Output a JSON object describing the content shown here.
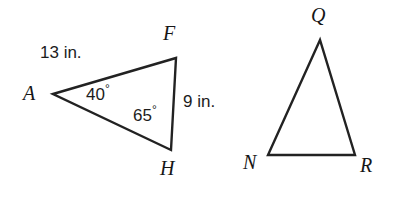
{
  "figure": {
    "background_color": "#ffffff",
    "stroke_color": "#222222",
    "stroke_width": 2.4,
    "width": 395,
    "height": 204
  },
  "triangle_left": {
    "name": "triangle-AFH",
    "vertices": [
      {
        "label": "A",
        "x": 53,
        "y": 94,
        "label_x": 23,
        "label_y": 83
      },
      {
        "label": "F",
        "x": 176,
        "y": 58,
        "label_x": 163,
        "label_y": 23
      },
      {
        "label": "H",
        "x": 171,
        "y": 150,
        "label_x": 160,
        "label_y": 158
      }
    ],
    "side_labels": [
      {
        "text": "13 in.",
        "side": "AF",
        "x": 40,
        "y": 44
      },
      {
        "text": "9 in.",
        "side": "FH",
        "x": 183,
        "y": 93
      }
    ],
    "angle_labels": [
      {
        "value": "40",
        "degree": "°",
        "at_vertex": "A",
        "x": 86,
        "y": 86
      },
      {
        "value": "65",
        "degree": "°",
        "at_vertex": "H",
        "x": 133,
        "y": 107
      }
    ]
  },
  "triangle_right": {
    "name": "triangle-QNR",
    "vertices": [
      {
        "label": "Q",
        "x": 320,
        "y": 40,
        "label_x": 311,
        "label_y": 5
      },
      {
        "label": "N",
        "x": 268,
        "y": 155,
        "label_x": 243,
        "label_y": 152
      },
      {
        "label": "R",
        "x": 355,
        "y": 155,
        "label_x": 360,
        "label_y": 155
      }
    ],
    "side_labels": [],
    "angle_labels": []
  }
}
